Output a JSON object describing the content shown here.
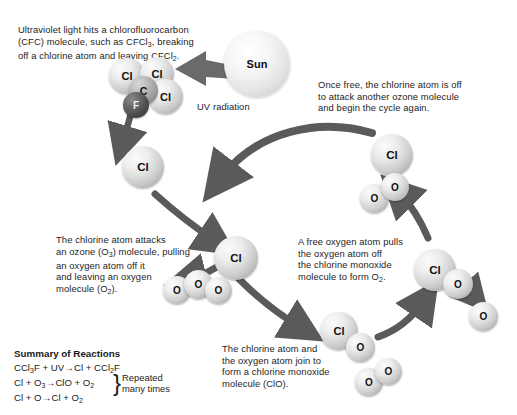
{
  "diagram": {
    "captions": {
      "uv_cfc": "Ultraviolet light hits a chlorofluorocarbon\n(CFC) molecule, such as CFCl3, breaking\noff a chlorine atom and leaving CFCl2.",
      "once_free": "Once free, the chlorine atom is off\nto attack another ozone molecule\nand begin the cycle again.",
      "attack_ozone": "The chlorine atom attacks\nan ozone (O3) molecule, pulling\nan oxygen atom off it\nand leaving an oxygen\nmolecule (O2).",
      "free_oxygen": "A free oxygen atom pulls\nthe oxygen atom off\nthe chlorine monoxide\nmolecule to form O2.",
      "form_clo": "The chlorine atom and\nthe oxygen atom join to\nform a chlorine monoxide\nmolecule (ClO)."
    },
    "labels": {
      "sun": "Sun",
      "uv_radiation": "UV radiation"
    },
    "atoms": {
      "cl": "Cl",
      "c": "C",
      "f": "F",
      "o": "O"
    },
    "colors": {
      "chlorine": "#d8d8d8",
      "carbon": "#9a9a9a",
      "fluorine": "#3a3a3a",
      "oxygen": "#d0d0d0",
      "arrow": "#5a5a5a",
      "background": "#ffffff",
      "text": "#1a1a1a"
    }
  },
  "summary": {
    "heading": "Summary of Reactions",
    "reactions": [
      {
        "left": "CCl3F + UV",
        "arrow": "→",
        "right": "Cl + CCl2F"
      },
      {
        "left": "Cl + O3",
        "arrow": "→",
        "right": "ClO + O2"
      },
      {
        "left": "Cl + O",
        "arrow": "→",
        "right": "Cl + O2"
      }
    ],
    "note": "Repeated\nmany times"
  }
}
